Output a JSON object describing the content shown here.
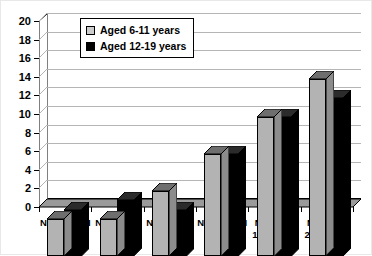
{
  "chart_data": {
    "type": "bar",
    "title": "",
    "xlabel": "",
    "ylabel": "",
    "ylim": [
      0,
      20
    ],
    "yticks": [
      0,
      2,
      4,
      6,
      8,
      10,
      12,
      14,
      16,
      18,
      20
    ],
    "grid": true,
    "legend_position": "top-left-inside",
    "categories": [
      "NHES II &III\n1963-70",
      "NHANES I\n1971-74",
      "NHANES II\n1976-80",
      "NHANES III\n1988-94",
      "NHANES\n1999-2000",
      "NHANES\n2003-2004"
    ],
    "category_lines": [
      {
        "line1": "NHES II &III",
        "line2": "1963-70"
      },
      {
        "line1": "NHANES I",
        "line2": "1971-74"
      },
      {
        "line1": "NHANES II",
        "line2": "1976-80"
      },
      {
        "line1": "NHANES III",
        "line2": "1988-94"
      },
      {
        "line1": "NHANES",
        "line2": "1999-2000"
      },
      {
        "line1": "NHANES",
        "line2": "2003-2004"
      }
    ],
    "series": [
      {
        "name": "Aged 6-11 years",
        "color": "#b3b3b3",
        "values": [
          4,
          4,
          7,
          11,
          15,
          19
        ]
      },
      {
        "name": "Aged 12-19 years",
        "color": "#000000",
        "values": [
          5,
          6,
          5,
          11,
          15,
          17
        ]
      }
    ]
  },
  "legend": {
    "entries": [
      {
        "label": "Aged 6-11 years",
        "swatch": "light"
      },
      {
        "label": "Aged 12-19 years",
        "swatch": "dark"
      }
    ]
  }
}
